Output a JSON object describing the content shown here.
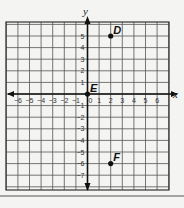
{
  "chart_data": {
    "type": "scatter",
    "title": "",
    "xlabel": "x",
    "ylabel": "y",
    "xlim": [
      -7,
      7
    ],
    "ylim": [
      -8,
      6
    ],
    "grid": true,
    "x_ticks": [
      "−6",
      "−5",
      "−4",
      "−3",
      "−2",
      "−1",
      "0",
      "1",
      "2",
      "3",
      "4",
      "5",
      "6"
    ],
    "y_ticks": [
      "5",
      "4",
      "3",
      "2",
      "1",
      "−1",
      "−2",
      "−3",
      "−4",
      "−5",
      "−6",
      "−7"
    ],
    "points": [
      {
        "label": "D",
        "x": 2,
        "y": 5
      },
      {
        "label": "E",
        "x": 0,
        "y": 0
      },
      {
        "label": "F",
        "x": 2,
        "y": -6
      }
    ]
  },
  "axes": {
    "x_name": "x",
    "y_name": "y",
    "origin_label": "0"
  },
  "points": [
    {
      "label": "D"
    },
    {
      "label": "E"
    },
    {
      "label": "F"
    }
  ]
}
